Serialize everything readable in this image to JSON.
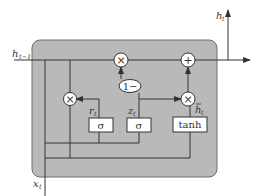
{
  "diagram": {
    "type": "GRU cell",
    "colors": {
      "cell_fill": "#b9b9b9",
      "cell_stroke": "#6e6e6e",
      "line": "#333333",
      "node_fill": "#ffffff"
    },
    "labels": {
      "h_prev": "h",
      "h_prev_sub": "t−1",
      "h_out": "h",
      "h_out_sub": "t",
      "x_in": "x",
      "x_in_sub": "t",
      "r_gate": "r",
      "r_gate_sub": "t",
      "z_gate": "z",
      "z_gate_sub": "t",
      "h_tilde": "h",
      "h_tilde_sub": "t"
    },
    "nodes": {
      "sigma_r": "σ",
      "sigma_z": "σ",
      "tanh": "tanh",
      "one_minus": "1−",
      "mult_symbol": "×",
      "add_symbol": "+"
    }
  }
}
